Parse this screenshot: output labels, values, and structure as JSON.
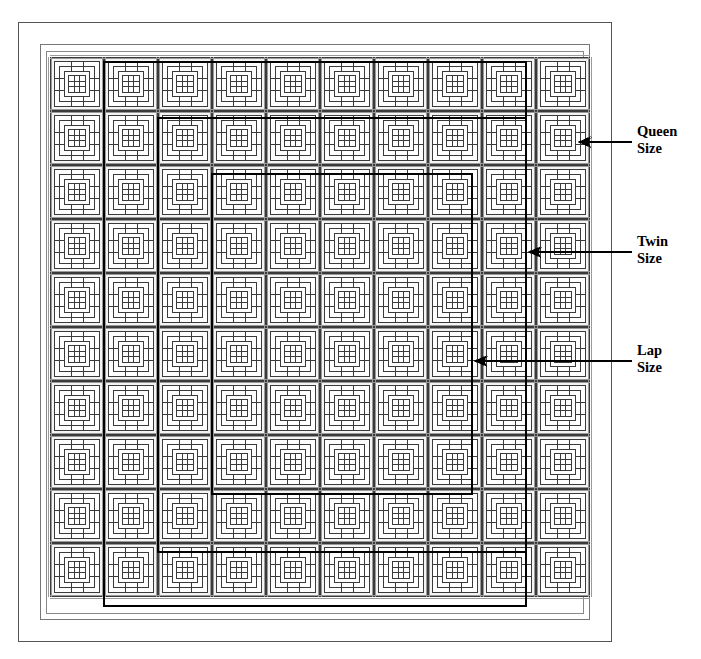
{
  "page": {
    "width": 701,
    "height": 659,
    "background": "#ffffff"
  },
  "quilt": {
    "name": "square-in-square-block-quilt",
    "blocks_across": 10,
    "blocks_down": 10,
    "total_blocks": 100,
    "block_size_px": 54,
    "grid_origin_x": 50,
    "grid_origin_y": 57,
    "line_color": "#3a3a3a",
    "heavy_line_color": "#000000",
    "fill_color": "#ffffff",
    "shade_color": "#f4f4f4",
    "outer_frame": {
      "x": 18,
      "y": 22,
      "width": 593,
      "height": 619
    },
    "inner_border": {
      "x": 40,
      "y": 44,
      "width": 549,
      "height": 575
    },
    "binding": {
      "x": 46,
      "y": 51,
      "width": 537,
      "height": 562
    }
  },
  "size_outlines": [
    {
      "id": "queen",
      "label_line1": "Queen",
      "label_line2": "Size",
      "rect": {
        "x": 104,
        "y": 62,
        "width": 422,
        "height": 544
      },
      "stroke_width": 2.4,
      "color": "#000000",
      "arrow": {
        "tip_x": 578,
        "tip_y": 142,
        "tail_x": 632,
        "tail_y": 142
      },
      "text_x": 637,
      "text_y": 136
    },
    {
      "id": "twin",
      "label_line1": "Twin",
      "label_line2": "Size",
      "rect": {
        "x": 158,
        "y": 118,
        "width": 368,
        "height": 434
      },
      "stroke_width": 2.4,
      "color": "#000000",
      "arrow": {
        "tip_x": 528,
        "tip_y": 252,
        "tail_x": 632,
        "tail_y": 252
      },
      "text_x": 637,
      "text_y": 246
    },
    {
      "id": "lap",
      "label_line1": "Lap",
      "label_line2": "Size",
      "rect": {
        "x": 212,
        "y": 174,
        "width": 260,
        "height": 320
      },
      "stroke_width": 2.4,
      "color": "#000000",
      "arrow": {
        "tip_x": 474,
        "tip_y": 361,
        "tail_x": 632,
        "tail_y": 361
      },
      "text_x": 637,
      "text_y": 355
    }
  ],
  "labels": {
    "queen": "Queen Size",
    "twin": "Twin Size",
    "lap": "Lap Size"
  }
}
